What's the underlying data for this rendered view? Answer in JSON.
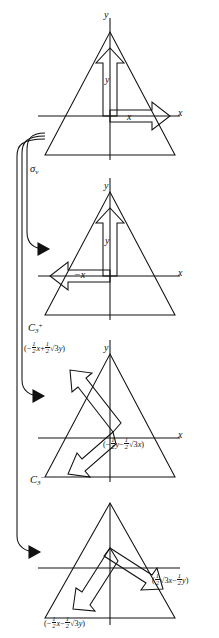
{
  "figure": {
    "panel_count": 4,
    "ink_color": "#111111",
    "background": "#ffffff"
  },
  "axes": {
    "x_label": "x",
    "y_label": "y",
    "neg_x_label": "−x"
  },
  "panels": [
    {
      "id": "panel-identity",
      "order": 1,
      "operation": "",
      "vector_labels": [
        "y",
        "x"
      ],
      "axis_labels": [
        "y",
        "x"
      ]
    },
    {
      "id": "panel-sigma-v",
      "order": 2,
      "operation": "σ",
      "operation_sub": "v",
      "vector_labels": [
        "y",
        "−x"
      ],
      "axis_labels": [
        "y",
        "x"
      ]
    },
    {
      "id": "panel-c3-plus",
      "order": 3,
      "operation": "C",
      "operation_sub": "3",
      "operation_sup": "+",
      "vector_labels": [
        "(−½x + ½√3y)",
        "(−½y − ½√3x)"
      ],
      "axis_labels": [
        "y",
        "x"
      ]
    },
    {
      "id": "panel-c3-minus",
      "order": 4,
      "operation": "C",
      "operation_sub": "3",
      "operation_sup": "−",
      "vector_labels": [
        "(½√3x − ½y)",
        "(−½x − ½√3y)"
      ],
      "axis_labels": []
    }
  ],
  "operation_labels": {
    "sigma_v": {
      "symbol": "σ",
      "subscript": "v"
    },
    "c3_plus": {
      "symbol": "C",
      "subscript": "3",
      "superscript": "+",
      "expression": "(−½x + ½√3y)"
    },
    "c3_minus": {
      "symbol": "C",
      "subscript": "3",
      "superscript": "−"
    }
  },
  "expressions": {
    "c3_plus_top": {
      "open": "(−",
      "n1": "1",
      "d1": "2",
      "v1": "x",
      "plus": "+",
      "n2": "1",
      "d2": "2",
      "rad": "√3",
      "v2": "y",
      "close": ")"
    },
    "c3_plus_bottom": {
      "open": "(−",
      "n1": "1",
      "d1": "2",
      "v1": "y",
      "minus": "−",
      "n2": "1",
      "d2": "2",
      "rad": "√3",
      "v2": "x",
      "close": ")"
    },
    "c3_minus_right": {
      "open": "(",
      "n1": "1",
      "d1": "2",
      "rad1": "√3",
      "v1": "x",
      "minus": "−",
      "n2": "1",
      "d2": "2",
      "v2": "y",
      "close": ")"
    },
    "c3_minus_bottom": {
      "open": "(−",
      "n1": "1",
      "d1": "2",
      "v1": "x",
      "minus": "−",
      "n2": "1",
      "d2": "2",
      "rad": "√3",
      "v2": "y",
      "close": ")"
    }
  }
}
